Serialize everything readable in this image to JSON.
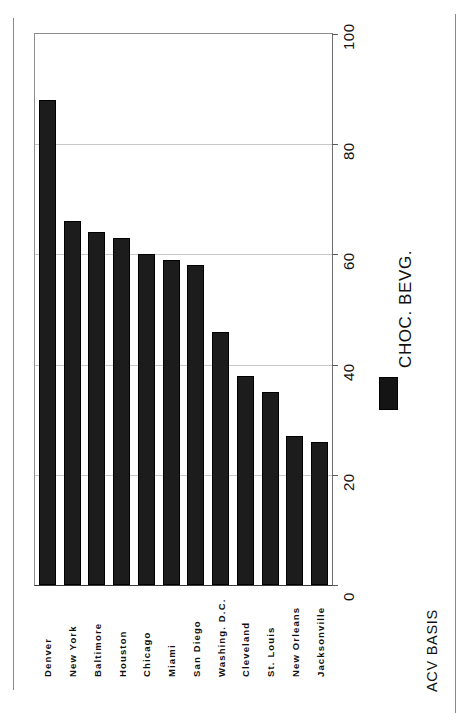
{
  "chart_data": {
    "type": "bar",
    "orientation": "rotated-90",
    "title": "",
    "xlabel": "",
    "ylabel": "",
    "categories": [
      "Denver",
      "New York",
      "Baltimore",
      "Houston",
      "Chicago",
      "Miami",
      "San Diego",
      "Washing. D.C.",
      "Cleveland",
      "St. Louis",
      "New Orleans",
      "Jacksonville"
    ],
    "values": [
      88,
      66,
      64,
      63,
      60,
      59,
      58,
      46,
      38,
      35,
      27,
      26
    ],
    "series": [
      {
        "name": "CHOC. BEVG.",
        "color": "#1c1c1c",
        "values": [
          88,
          66,
          64,
          63,
          60,
          59,
          58,
          46,
          38,
          35,
          27,
          26
        ]
      }
    ],
    "ylim": [
      0,
      100
    ],
    "ticks": [
      "0",
      "20",
      "40",
      "60",
      "80",
      "100"
    ],
    "tick_values": [
      0,
      20,
      40,
      60,
      80,
      100
    ],
    "grid": true,
    "legend_position": "right",
    "annotation": "ACV BASIS"
  },
  "legend": {
    "label": "CHOC. BEVG."
  },
  "footnote": {
    "text": "ACV BASIS"
  },
  "colors": {
    "bar": "#1c1c1c",
    "grid": "#c8c8c8",
    "axis": "#3a3a3a",
    "text": "#111111",
    "background": "#ffffff"
  }
}
